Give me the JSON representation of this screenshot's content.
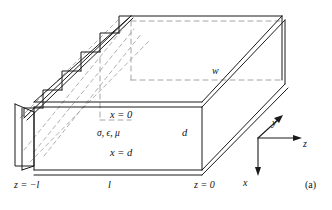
{
  "figure": {
    "caption": "(a)",
    "type": "3d-waveguide-diagram"
  },
  "labels": {
    "x_top": "x = 0",
    "x_bottom": "x = d",
    "material": "σ, ϵ, μ",
    "plate_separation": "d",
    "width": "w",
    "z_left": "z = −l",
    "length": "l",
    "z_right": "z = 0"
  },
  "axes": {
    "x": "x",
    "y": "y",
    "z": "z"
  },
  "colors": {
    "line": "#1a1a1a",
    "hidden": "#8d8d8d",
    "background": "#ffffff"
  }
}
